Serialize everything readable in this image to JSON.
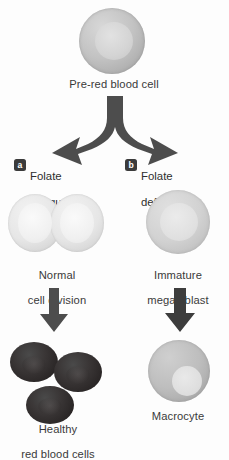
{
  "diagram": {
    "background_color": "#fdfdfd",
    "arrow_color": "#4d4d4d",
    "badge_color": "#3b3b3b",
    "cell_grey": "#c3c3c3",
    "rbc_dark": "#2a2626"
  },
  "top": {
    "caption": "Pre-red blood cell",
    "cell_name": "pre-red-blood-cell"
  },
  "branches": [
    {
      "badge": "a",
      "label": "Folate\nadequate",
      "label_line1": "Folate",
      "label_line2": "adequate",
      "stage_caption": "Normal\ncell division",
      "stage_line1": "Normal",
      "stage_line2": "cell division",
      "outcome_caption": "Healthy\nred blood cells",
      "outcome_line1": "Healthy",
      "outcome_line2": "red blood cells"
    },
    {
      "badge": "b",
      "label": "Folate\ndeficient*",
      "label_line1": "Folate",
      "label_line2": "deficient*",
      "stage_caption": "Immature\nmegaloblast",
      "stage_line1": "Immature",
      "stage_line2": "megaloblast",
      "outcome_caption": "Macrocyte",
      "outcome_line1": "Macrocyte",
      "outcome_line2": ""
    }
  ],
  "icons": {
    "split_arrow": "branching-y-arrow",
    "down_arrow_left": "down-arrow",
    "down_arrow_right": "down-arrow"
  }
}
